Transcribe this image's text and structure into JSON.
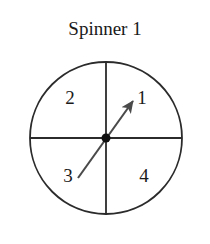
{
  "figure": {
    "title": "Spinner 1",
    "kind": "spinner-diagram",
    "colors": {
      "background": "#ffffff",
      "stroke": "#2b2b2b",
      "arrow": "#4a4a4a",
      "text": "#1a1a1a"
    },
    "circle": {
      "center_x": 106,
      "center_y": 138,
      "radius": 76
    },
    "divider_lines": [
      {
        "name": "vertical-divider",
        "x1": 106,
        "y1": 62,
        "x2": 106,
        "y2": 214
      },
      {
        "name": "horizontal-divider",
        "x1": 30,
        "y1": 138,
        "x2": 182,
        "y2": 138
      }
    ],
    "center_dot": {
      "cx": 106,
      "cy": 138,
      "r": 4.5
    },
    "pointer": {
      "tail_x": 78,
      "tail_y": 178,
      "tip_x": 135,
      "tip_y": 99,
      "points_to": "1",
      "angle_degrees": 54
    },
    "sectors": [
      {
        "label": "1",
        "quadrant": "top-right",
        "x": 142,
        "y": 100
      },
      {
        "label": "2",
        "quadrant": "top-left",
        "x": 70,
        "y": 100
      },
      {
        "label": "3",
        "quadrant": "bottom-left",
        "x": 68,
        "y": 178
      },
      {
        "label": "4",
        "quadrant": "bottom-right",
        "x": 144,
        "y": 178
      }
    ]
  }
}
